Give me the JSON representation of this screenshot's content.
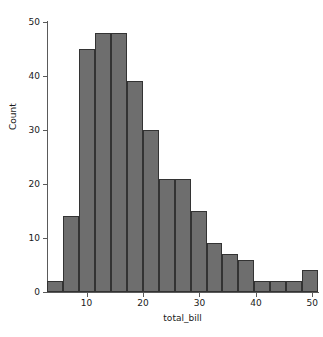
{
  "chart_data": {
    "type": "bar",
    "title": "",
    "subtitle": "",
    "xlabel": "total_bill",
    "ylabel": "Count",
    "xlim": [
      3.0,
      51.0
    ],
    "ylim": [
      0,
      50
    ],
    "grid": false,
    "legend": null,
    "xticks": [
      10,
      20,
      30,
      40,
      50
    ],
    "xtick_labels": [
      "10",
      "20",
      "30",
      "40",
      "50"
    ],
    "yticks": [
      0,
      10,
      20,
      30,
      40,
      50
    ],
    "ytick_labels": [
      "0",
      "10",
      "20",
      "30",
      "40",
      "50"
    ],
    "bar_color": "#6e6e6e",
    "bar_edge_color": "#333333",
    "bin_width": 2.82,
    "bins": [
      {
        "left": 3.07,
        "right": 5.89,
        "center": 4.48,
        "value": 2
      },
      {
        "left": 5.89,
        "right": 8.71,
        "center": 7.3,
        "value": 14
      },
      {
        "left": 8.71,
        "right": 11.52,
        "center": 10.12,
        "value": 45
      },
      {
        "left": 11.52,
        "right": 14.34,
        "center": 12.93,
        "value": 48
      },
      {
        "left": 14.34,
        "right": 17.16,
        "center": 15.75,
        "value": 48
      },
      {
        "left": 17.16,
        "right": 19.98,
        "center": 18.57,
        "value": 39
      },
      {
        "left": 19.98,
        "right": 22.8,
        "center": 21.39,
        "value": 30
      },
      {
        "left": 22.8,
        "right": 25.62,
        "center": 24.21,
        "value": 21
      },
      {
        "left": 25.62,
        "right": 28.44,
        "center": 27.03,
        "value": 21
      },
      {
        "left": 28.44,
        "right": 31.26,
        "center": 29.85,
        "value": 15
      },
      {
        "left": 31.26,
        "right": 34.08,
        "center": 32.67,
        "value": 9
      },
      {
        "left": 34.08,
        "right": 36.9,
        "center": 35.49,
        "value": 7
      },
      {
        "left": 36.9,
        "right": 39.72,
        "center": 38.31,
        "value": 6
      },
      {
        "left": 39.72,
        "right": 42.54,
        "center": 41.13,
        "value": 2
      },
      {
        "left": 42.54,
        "right": 45.36,
        "center": 43.95,
        "value": 2
      },
      {
        "left": 45.36,
        "right": 48.18,
        "center": 46.77,
        "value": 2
      },
      {
        "left": 48.18,
        "right": 51.0,
        "center": 49.59,
        "value": 4
      }
    ],
    "categories": [
      "3.1-5.9",
      "5.9-8.7",
      "8.7-11.5",
      "11.5-14.3",
      "14.3-17.2",
      "17.2-20.0",
      "20.0-22.8",
      "22.8-25.6",
      "25.6-28.4",
      "28.4-31.3",
      "31.3-34.1",
      "34.1-36.9",
      "36.9-39.7",
      "39.7-42.5",
      "42.5-45.4",
      "45.4-48.2",
      "48.2-51.0"
    ],
    "values": [
      2,
      14,
      45,
      48,
      48,
      39,
      30,
      21,
      21,
      15,
      9,
      7,
      6,
      2,
      2,
      2,
      4
    ]
  }
}
